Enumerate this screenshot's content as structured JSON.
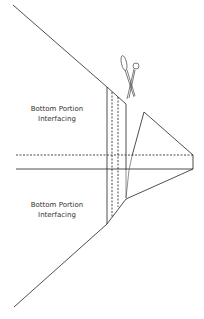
{
  "diagram": {
    "labels": {
      "upper": [
        "Bottom Portion",
        "Interfacing"
      ],
      "lower": [
        "Bottom Portion",
        "Interfacing"
      ]
    },
    "icons": [
      "scissors-icon"
    ],
    "line_styles": {
      "cut_line": "solid",
      "fold_line": "dashed"
    },
    "colors": {
      "line": "#222222",
      "text": "#333333",
      "background": "#ffffff"
    }
  }
}
